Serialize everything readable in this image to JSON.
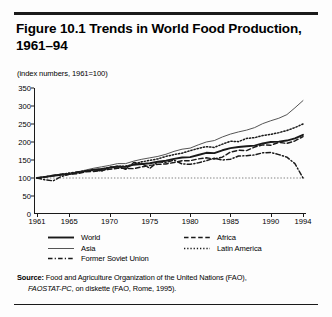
{
  "figure": {
    "title": "Figure 10.1  Trends in World Food Production, 1961–94",
    "subtitle": "(index numbers, 1961=100)"
  },
  "source": {
    "lead": "Source:",
    "text": " Food and Agriculture Organization of the United Nations (FAO),",
    "italic": "FAOSTAT-PC",
    "tail": ", on diskette (FAO, Rome, 1995)."
  },
  "legend": {
    "column1": [
      {
        "label": "World",
        "style": "solid-thick",
        "color": "#1a1a1a"
      },
      {
        "label": "Asia",
        "style": "solid-thin",
        "color": "#555555"
      },
      {
        "label": "Former Soviet Union",
        "style": "dash-dot",
        "color": "#1a1a1a"
      }
    ],
    "column2": [
      {
        "label": "Africa",
        "style": "dashed",
        "color": "#1a1a1a"
      },
      {
        "label": "Latin America",
        "style": "dotted",
        "color": "#1a1a1a"
      }
    ]
  },
  "chart_data": {
    "type": "line",
    "title": "Figure 10.1  Trends in World Food Production, 1961–94",
    "subtitle": "(index numbers, 1961=100)",
    "xlabel": "",
    "ylabel": "",
    "xlim": [
      1961,
      1994
    ],
    "ylim": [
      0,
      350
    ],
    "yticks": [
      0,
      50,
      100,
      150,
      200,
      250,
      300,
      350
    ],
    "xticks": [
      1961,
      1965,
      1970,
      1975,
      1980,
      1985,
      1990,
      1994
    ],
    "grid": false,
    "legend_position": "below-axes",
    "reference_line": {
      "value": 100,
      "style": "dotted",
      "label": "1961=100"
    },
    "x": [
      1961,
      1962,
      1963,
      1964,
      1965,
      1966,
      1967,
      1968,
      1969,
      1970,
      1971,
      1972,
      1973,
      1974,
      1975,
      1976,
      1977,
      1978,
      1979,
      1980,
      1981,
      1982,
      1983,
      1984,
      1985,
      1986,
      1987,
      1988,
      1989,
      1990,
      1991,
      1992,
      1993,
      1994
    ],
    "series": [
      {
        "name": "World",
        "style": "solid-thick",
        "color": "#1a1a1a",
        "values": [
          100,
          103,
          106,
          109,
          111,
          115,
          119,
          123,
          125,
          128,
          132,
          131,
          137,
          139,
          141,
          145,
          148,
          153,
          157,
          158,
          164,
          170,
          169,
          177,
          183,
          186,
          188,
          190,
          196,
          200,
          201,
          204,
          210,
          220
        ]
      },
      {
        "name": "Asia",
        "style": "solid-thin",
        "color": "#555555",
        "values": [
          100,
          103,
          107,
          111,
          112,
          117,
          122,
          127,
          131,
          135,
          140,
          140,
          147,
          152,
          156,
          160,
          166,
          174,
          180,
          183,
          192,
          200,
          204,
          214,
          222,
          228,
          233,
          240,
          251,
          259,
          266,
          276,
          295,
          315
        ]
      },
      {
        "name": "Former Soviet Union",
        "style": "dash-dot",
        "color": "#1a1a1a",
        "values": [
          100,
          95,
          92,
          104,
          110,
          117,
          118,
          124,
          119,
          130,
          132,
          124,
          143,
          140,
          127,
          145,
          143,
          150,
          139,
          138,
          142,
          148,
          155,
          150,
          152,
          161,
          162,
          164,
          170,
          171,
          165,
          158,
          140,
          100
        ]
      },
      {
        "name": "Africa",
        "style": "dashed",
        "color": "#1a1a1a",
        "values": [
          100,
          103,
          108,
          110,
          111,
          112,
          117,
          118,
          121,
          124,
          127,
          127,
          126,
          131,
          135,
          138,
          139,
          143,
          148,
          148,
          153,
          156,
          153,
          158,
          172,
          177,
          176,
          186,
          192,
          191,
          199,
          196,
          203,
          215
        ]
      },
      {
        "name": "Latin America",
        "style": "dotted",
        "color": "#1a1a1a",
        "values": [
          100,
          103,
          106,
          110,
          114,
          116,
          120,
          122,
          124,
          130,
          132,
          133,
          138,
          145,
          149,
          153,
          160,
          165,
          169,
          176,
          182,
          187,
          185,
          194,
          202,
          201,
          210,
          212,
          218,
          221,
          226,
          232,
          240,
          250
        ]
      }
    ]
  }
}
